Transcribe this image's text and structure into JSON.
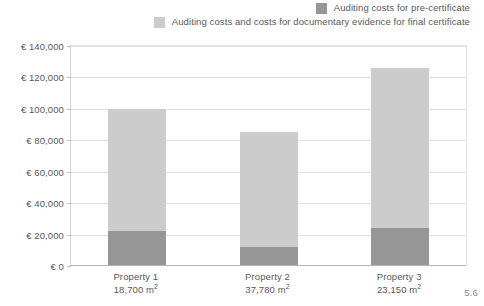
{
  "chart_data": {
    "type": "bar",
    "subtype": "stacked-column",
    "title": "",
    "xlabel": "",
    "ylabel": "",
    "categories": [
      "Property 1",
      "Property 2",
      "Property 3"
    ],
    "category_sublabels": [
      "18,700 m²",
      "37,780 m²",
      "23,150 m²"
    ],
    "series": [
      {
        "name": "Auditing costs for pre-certificate",
        "color": "#969696",
        "values": [
          22000,
          12000,
          24000
        ]
      },
      {
        "name": "Auditing costs and costs for documentary evidence for final certificate",
        "color": "#cccccc",
        "values": [
          78000,
          73000,
          102000
        ]
      }
    ],
    "totals": [
      100000,
      85000,
      126000
    ],
    "ylim": [
      0,
      140000
    ],
    "ytick_step": 20000,
    "ytick_labels": [
      "€ 140,000",
      "€ 120,000",
      "€ 100,000",
      "€ 80,000",
      "€ 60,000",
      "€ 40,000",
      "€ 20,000",
      "€ 0"
    ],
    "ytick_values": [
      140000,
      120000,
      100000,
      80000,
      60000,
      40000,
      20000,
      0
    ],
    "grid": true,
    "legend_position": "top-right",
    "currency_symbol": "€"
  },
  "legend": {
    "items": [
      {
        "label": "Auditing costs for pre-certificate",
        "swatch_color": "#969696",
        "swatch_name": "legend-swatch-pre-certificate"
      },
      {
        "label": "Auditing costs and costs for documentary evidence for final certificate",
        "swatch_color": "#cccccc",
        "swatch_name": "legend-swatch-final-certificate"
      }
    ]
  },
  "figure": {
    "caption": "5.6"
  },
  "colors": {
    "dark_gray": "#969696",
    "light_gray": "#cccccc",
    "gridline": "#e2e2e2",
    "axis": "#b5b5b5",
    "text": "#58585a",
    "caption_text": "#8a8a8a",
    "background": "#ffffff"
  }
}
